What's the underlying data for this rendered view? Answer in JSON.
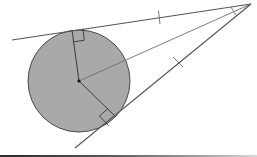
{
  "diagram": {
    "colors": {
      "background": "#ffffff",
      "circle_fill": "#a9a9a9",
      "circle_stroke": "#4a4a4a",
      "line": "#555555",
      "center_line": "#7a7a7a"
    },
    "circle": {
      "cx": 79,
      "cy": 81,
      "r": 51
    },
    "center_point": {
      "x": 79,
      "y": 81
    },
    "external_point": {
      "x": 251,
      "y": 4
    },
    "tangent_points": [
      {
        "name": "upper",
        "x": 72,
        "y": 30
      },
      {
        "name": "lower",
        "x": 116,
        "y": 117
      }
    ],
    "tangent_lines": [
      {
        "name": "upper",
        "x1": 12,
        "y1": 40,
        "x2": 251,
        "y2": 4
      },
      {
        "name": "lower",
        "x1": 251,
        "y1": 4,
        "x2": 75,
        "y2": 148
      }
    ],
    "radii": [
      {
        "name": "to-upper-tangent",
        "x1": 79,
        "y1": 81,
        "x2": 72,
        "y2": 30
      },
      {
        "name": "to-lower-tangent",
        "x1": 79,
        "y1": 81,
        "x2": 116,
        "y2": 117
      }
    ],
    "center_to_external_line": {
      "x1": 79,
      "y1": 81,
      "x2": 251,
      "y2": 4
    },
    "right_angle_markers": 2,
    "equal_length_ticks": [
      {
        "x": 159,
        "y": 17
      },
      {
        "x": 178,
        "y": 62
      }
    ],
    "angle_marks_at_external_point": 1
  }
}
